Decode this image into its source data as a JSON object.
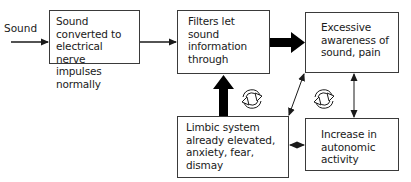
{
  "diagram": {
    "type": "flowchart",
    "input_label": "Sound",
    "nodes": [
      {
        "id": "converted",
        "text": "Sound converted to electrical nerve impulses normally"
      },
      {
        "id": "filters",
        "text": "Filters let sound information through"
      },
      {
        "id": "awareness",
        "text": "Excessive awareness of sound, pain"
      },
      {
        "id": "limbic",
        "text": "Limbic system already elevated, anxiety, fear, dismay"
      },
      {
        "id": "autonomic",
        "text": "Increase in autonomic activity"
      }
    ],
    "edges": [
      {
        "from": "input",
        "to": "converted",
        "style": "thin"
      },
      {
        "from": "converted",
        "to": "filters",
        "style": "thin"
      },
      {
        "from": "filters",
        "to": "awareness",
        "style": "thick"
      },
      {
        "from": "limbic",
        "to": "filters",
        "style": "thick"
      },
      {
        "from": "limbic",
        "to": "awareness",
        "style": "thin-bidirectional"
      },
      {
        "from": "awareness",
        "to": "autonomic",
        "style": "thin-bidirectional"
      },
      {
        "from": "limbic",
        "to": "autonomic",
        "style": "thin-bidirectional"
      }
    ],
    "cycle_icons": [
      "cycle-icon-left",
      "cycle-icon-right"
    ]
  }
}
